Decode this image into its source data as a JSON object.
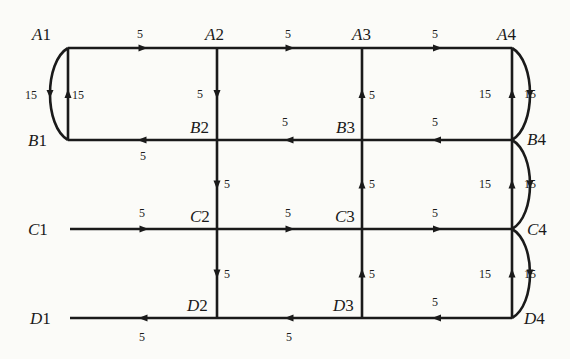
{
  "diagram": {
    "type": "directed street network",
    "nodes": [
      {
        "id": "A1",
        "letter": "A",
        "num": "1",
        "x": 68,
        "y": 48,
        "lx": 32,
        "ly": 40
      },
      {
        "id": "A2",
        "letter": "A",
        "num": "2",
        "x": 217,
        "y": 48,
        "lx": 205,
        "ly": 40
      },
      {
        "id": "A3",
        "letter": "A",
        "num": "3",
        "x": 362,
        "y": 48,
        "lx": 352,
        "ly": 40
      },
      {
        "id": "A4",
        "letter": "A",
        "num": "4",
        "x": 512,
        "y": 48,
        "lx": 497,
        "ly": 40
      },
      {
        "id": "B1",
        "letter": "B",
        "num": "1",
        "x": 68,
        "y": 140,
        "lx": 28,
        "ly": 146
      },
      {
        "id": "B2",
        "letter": "B",
        "num": "2",
        "x": 217,
        "y": 140,
        "lx": 190,
        "ly": 133
      },
      {
        "id": "B3",
        "letter": "B",
        "num": "3",
        "x": 362,
        "y": 140,
        "lx": 336,
        "ly": 133
      },
      {
        "id": "B4",
        "letter": "B",
        "num": "4",
        "x": 512,
        "y": 140,
        "lx": 527,
        "ly": 145
      },
      {
        "id": "C1",
        "letter": "C",
        "num": "1",
        "x": 70,
        "y": 229,
        "lx": 28,
        "ly": 235
      },
      {
        "id": "C2",
        "letter": "C",
        "num": "2",
        "x": 217,
        "y": 229,
        "lx": 190,
        "ly": 222
      },
      {
        "id": "C3",
        "letter": "C",
        "num": "3",
        "x": 362,
        "y": 229,
        "lx": 335,
        "ly": 222
      },
      {
        "id": "C4",
        "letter": "C",
        "num": "4",
        "x": 512,
        "y": 229,
        "lx": 527,
        "ly": 235
      },
      {
        "id": "D1",
        "letter": "D",
        "num": "1",
        "x": 70,
        "y": 318,
        "lx": 30,
        "ly": 324
      },
      {
        "id": "D2",
        "letter": "D",
        "num": "2",
        "x": 217,
        "y": 318,
        "lx": 187,
        "ly": 311
      },
      {
        "id": "D3",
        "letter": "D",
        "num": "3",
        "x": 362,
        "y": 318,
        "lx": 333,
        "ly": 311
      },
      {
        "id": "D4",
        "letter": "D",
        "num": "4",
        "x": 512,
        "y": 318,
        "lx": 524,
        "ly": 324
      }
    ],
    "edges": [
      {
        "from": "A1",
        "to": "A2",
        "weight": "5",
        "wx": 140,
        "wy": 38
      },
      {
        "from": "A2",
        "to": "A3",
        "weight": "5",
        "wx": 288,
        "wy": 38
      },
      {
        "from": "A3",
        "to": "A4",
        "weight": "5",
        "wx": 435,
        "wy": 38
      },
      {
        "from": "A2",
        "to": "B2",
        "weight": "5",
        "wx": 200,
        "wy": 98
      },
      {
        "from": "B3",
        "to": "A3",
        "weight": "5",
        "wx": 372,
        "wy": 99
      },
      {
        "from": "A1",
        "to": "B1",
        "weight": "15",
        "wx": 31,
        "wy": 99,
        "curved": true
      },
      {
        "from": "B1",
        "to": "A1",
        "weight": "15",
        "wx": 78,
        "wy": 99
      },
      {
        "from": "B4",
        "to": "A4",
        "weight": "15",
        "wx": 485,
        "wy": 98
      },
      {
        "from": "A4",
        "to": "B4",
        "weight": "15",
        "wx": 530,
        "wy": 98,
        "curved": true
      },
      {
        "from": "B2",
        "to": "B1",
        "weight": "5",
        "wx": 143,
        "wy": 160
      },
      {
        "from": "B3",
        "to": "B2",
        "weight": "5",
        "wx": 285,
        "wy": 126
      },
      {
        "from": "B4",
        "to": "B3",
        "weight": "5",
        "wx": 435,
        "wy": 126
      },
      {
        "from": "B2",
        "to": "C2",
        "weight": "5",
        "wx": 227,
        "wy": 188
      },
      {
        "from": "C3",
        "to": "B3",
        "weight": "5",
        "wx": 372,
        "wy": 188
      },
      {
        "from": "C4",
        "to": "B4",
        "weight": "15",
        "wx": 485,
        "wy": 188
      },
      {
        "from": "B4",
        "to": "C4",
        "weight": "15",
        "wx": 530,
        "wy": 188,
        "curved": true
      },
      {
        "from": "C1",
        "to": "C2",
        "weight": "5",
        "wx": 142,
        "wy": 217
      },
      {
        "from": "C2",
        "to": "C3",
        "weight": "5",
        "wx": 288,
        "wy": 217
      },
      {
        "from": "C3",
        "to": "C4",
        "weight": "5",
        "wx": 435,
        "wy": 217
      },
      {
        "from": "C2",
        "to": "D2",
        "weight": "5",
        "wx": 227,
        "wy": 278
      },
      {
        "from": "D3",
        "to": "C3",
        "weight": "5",
        "wx": 372,
        "wy": 278
      },
      {
        "from": "D4",
        "to": "C4",
        "weight": "15",
        "wx": 485,
        "wy": 278
      },
      {
        "from": "C4",
        "to": "D4",
        "weight": "15",
        "wx": 530,
        "wy": 278,
        "curved": true
      },
      {
        "from": "D2",
        "to": "D1",
        "weight": "5",
        "wx": 142,
        "wy": 341
      },
      {
        "from": "D3",
        "to": "D2",
        "weight": "5",
        "wx": 289,
        "wy": 341
      },
      {
        "from": "D4",
        "to": "D3",
        "weight": "5",
        "wx": 435,
        "wy": 306
      }
    ]
  }
}
